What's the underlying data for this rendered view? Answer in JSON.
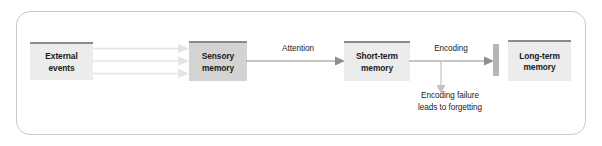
{
  "figure": {
    "frame": {
      "shape": "rounded-rectangle",
      "border_color": "#c9c9c9"
    },
    "colors": {
      "box_light_fill": "#ececec",
      "box_dark_fill": "#d3d3d3",
      "box_top_rule": "#8a8a8a",
      "arrow_dark": "#8e8e8e",
      "arrow_faint": "#e2e2e2",
      "gate_bar": "#b5b5b5",
      "text": "#1b1b1b",
      "background": "#ffffff"
    },
    "nodes": [
      {
        "id": "external",
        "label": "External\nevents",
        "fill": "light"
      },
      {
        "id": "sensory",
        "label": "Sensory\nmemory",
        "fill": "dark"
      },
      {
        "id": "short",
        "label": "Short-term\nmemory",
        "fill": "light"
      },
      {
        "id": "long",
        "label": "Long-term\nmemory",
        "fill": "light"
      }
    ],
    "gate": {
      "id": "encoding-gate",
      "label": ""
    },
    "edges": [
      {
        "id": "external-to-sensory",
        "label": "",
        "style": "faint-triple-arrow",
        "from": "external",
        "to": "sensory"
      },
      {
        "id": "sensory-to-short",
        "label": "Attention",
        "style": "arrow",
        "from": "sensory",
        "to": "short"
      },
      {
        "id": "short-to-long",
        "label": "Encoding",
        "style": "arrow",
        "from": "short",
        "to": "long"
      },
      {
        "id": "encoding-failure",
        "label": "Encoding failure\nleads to forgetting",
        "style": "down-arrow",
        "from": "short-to-long",
        "to": ""
      }
    ]
  }
}
